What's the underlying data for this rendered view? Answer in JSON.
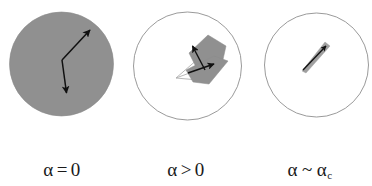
{
  "figure": {
    "background_color": "#ffffff",
    "panel_count": 3,
    "stroke_color": "#1a1a1a",
    "fill_gray": "#909090",
    "circle_outline_color": "#6b6b6b"
  },
  "panels": [
    {
      "id": "panel-alpha-zero",
      "label_alpha": "α",
      "label_relation": "=",
      "label_value": "0",
      "label_subscript": "",
      "label_full": "α = 0",
      "circle": {
        "cx": 61.5,
        "cy": 64,
        "r": 52,
        "filled": true,
        "fill": "#909090"
      },
      "arrows": [
        {
          "name": "arrow-up-right",
          "x1": 62,
          "y1": 60,
          "x2": 92,
          "y2": 28
        },
        {
          "name": "arrow-down-left",
          "x1": 62,
          "y1": 60,
          "x2": 67,
          "y2": 96
        }
      ],
      "polygon_points": "",
      "description": "uniform gray disc with two black arrows from a common vertex"
    },
    {
      "id": "panel-alpha-positive",
      "label_alpha": "α",
      "label_relation": ">",
      "label_value": "0",
      "label_subscript": "",
      "label_full": "α > 0",
      "circle": {
        "cx": 187.5,
        "cy": 66,
        "r": 54,
        "filled": false,
        "fill": "none"
      },
      "arrows": [
        {
          "name": "arrow-up-left",
          "x1": 202,
          "y1": 68,
          "x2": 192,
          "y2": 45
        },
        {
          "name": "arrow-down-right",
          "x1": 186,
          "y1": 72,
          "x2": 215,
          "y2": 63
        }
      ],
      "polygon_points": "190,52 207,36 224,45 221,66 200,80",
      "description": "empty circle containing a gray pentagon cluster with two black arrows and thin wedge lines"
    },
    {
      "id": "panel-alpha-critical",
      "label_alpha": "α",
      "label_relation": "~",
      "label_value": "α",
      "label_subscript": "c",
      "label_full": "α ~ αc",
      "circle": {
        "cx": 316.5,
        "cy": 65,
        "r": 52,
        "filled": false,
        "fill": "none"
      },
      "arrows": [
        {
          "name": "arrow-needle",
          "x1": 303,
          "y1": 69,
          "x2": 327,
          "y2": 45
        }
      ],
      "polygon_points": "303,69 325,43 331,47 308,72",
      "description": "empty circle containing a thin needle-like sliver with a black arrowhead"
    }
  ]
}
